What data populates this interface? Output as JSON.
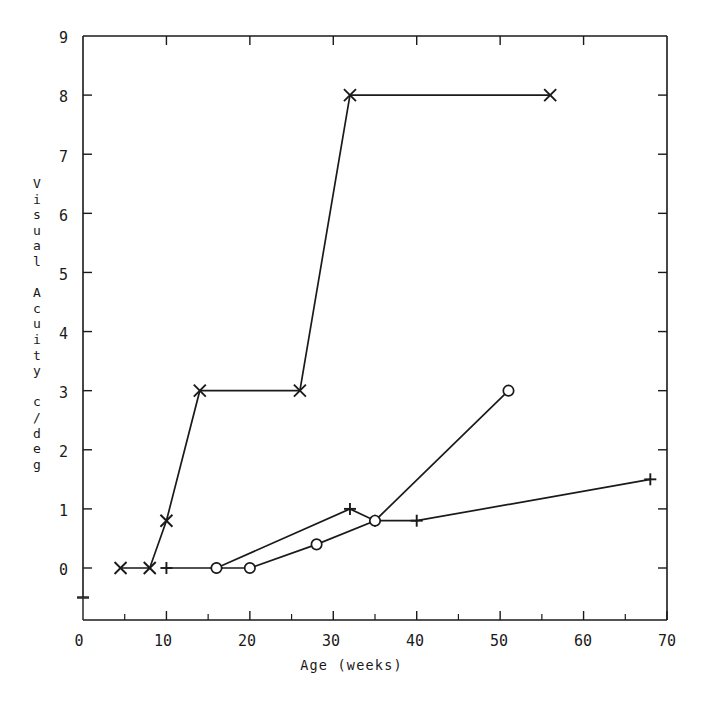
{
  "chart_data": {
    "type": "line",
    "title": "",
    "xlabel": "Age (weeks)",
    "ylabel": "Visual Acuity c/deg",
    "ylabel_chars": [
      "V",
      "i",
      "s",
      "u",
      "a",
      "l",
      " ",
      "A",
      "c",
      "u",
      "i",
      "t",
      "y",
      " ",
      "c",
      "/",
      "d",
      "e",
      "g"
    ],
    "xlim": [
      0,
      70
    ],
    "ylim": [
      0,
      9
    ],
    "xticks": [
      0,
      10,
      20,
      30,
      40,
      50,
      60,
      70
    ],
    "xtick_labels": [
      "0",
      "10",
      "20",
      "30",
      "40",
      "50",
      "60",
      "70"
    ],
    "xminor_step": 5,
    "yticks": [
      0,
      1,
      2,
      3,
      4,
      5,
      6,
      7,
      8,
      9
    ],
    "ytick_labels": [
      "0",
      "1",
      "2",
      "3",
      "4",
      "5",
      "6",
      "7",
      "8",
      "9"
    ],
    "grid": false,
    "legend": "none",
    "line_color": "#1a1a1a",
    "background": "#ffffff",
    "series": [
      {
        "name": "cross-series",
        "marker": "cross",
        "points": [
          {
            "x": 4.5,
            "y": 0
          },
          {
            "x": 8,
            "y": 0
          },
          {
            "x": 10,
            "y": 0.8
          },
          {
            "x": 14,
            "y": 3
          },
          {
            "x": 26,
            "y": 3
          },
          {
            "x": 32,
            "y": 8
          },
          {
            "x": 56,
            "y": 8
          }
        ]
      },
      {
        "name": "plus-series",
        "marker": "plus",
        "points": [
          {
            "x": 10,
            "y": 0
          },
          {
            "x": 16,
            "y": 0
          },
          {
            "x": 32,
            "y": 1.0
          },
          {
            "x": 35,
            "y": 0.8
          },
          {
            "x": 40,
            "y": 0.8
          },
          {
            "x": 68,
            "y": 1.5
          }
        ]
      },
      {
        "name": "circle-series",
        "marker": "circle",
        "points": [
          {
            "x": 16,
            "y": 0
          },
          {
            "x": 20,
            "y": 0
          },
          {
            "x": 28,
            "y": 0.4
          },
          {
            "x": 35,
            "y": 0.8
          },
          {
            "x": 51,
            "y": 3
          }
        ]
      }
    ]
  }
}
